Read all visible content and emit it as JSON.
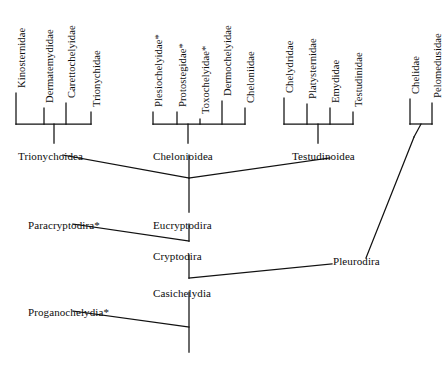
{
  "diagram": {
    "type": "cladogram",
    "title": "",
    "line_color": "#111111",
    "background_color": "#ffffff",
    "extinct_marker": "*",
    "terminal_taxa": [
      {
        "label": "Kinosternidae",
        "x": 16,
        "tip_y": 93,
        "label_y": 88
      },
      {
        "label": "Dermatemydidae",
        "x": 44,
        "tip_y": 108,
        "label_y": 88
      },
      {
        "label": "Carettochelyidae",
        "x": 66,
        "tip_y": 103,
        "label_y": 88
      },
      {
        "label": "Trionychidae",
        "x": 91,
        "tip_y": 112,
        "label_y": 88
      },
      {
        "label": "Plesiochelyidae*",
        "x": 153,
        "tip_y": 112,
        "label_y": 88
      },
      {
        "label": "Protostegidae*",
        "x": 177,
        "tip_y": 112,
        "label_y": 88
      },
      {
        "label": "Toxochelyidae*",
        "x": 200,
        "tip_y": 119,
        "label_y": 88
      },
      {
        "label": "Dermochelyidae",
        "x": 222,
        "tip_y": 101,
        "label_y": 88
      },
      {
        "label": "Cheloniidae",
        "x": 245,
        "tip_y": 108,
        "label_y": 88
      },
      {
        "label": "Chelydridae",
        "x": 284,
        "tip_y": 98,
        "label_y": 88
      },
      {
        "label": "Platysternidae",
        "x": 307,
        "tip_y": 104,
        "label_y": 88
      },
      {
        "label": "Emydidae",
        "x": 330,
        "tip_y": 108,
        "label_y": 88
      },
      {
        "label": "Testudinidae",
        "x": 353,
        "tip_y": 112,
        "label_y": 88
      },
      {
        "label": "Chelidae",
        "x": 410,
        "tip_y": 99,
        "label_y": 88
      },
      {
        "label": "Pelomedusidae",
        "x": 432,
        "tip_y": 103,
        "label_y": 88
      }
    ],
    "clade_labels": [
      {
        "name": "Trionychoidea",
        "label": "Trionychoidea",
        "x": 18,
        "y": 150
      },
      {
        "name": "Chelonioidea",
        "label": "Chelonioidea",
        "x": 153,
        "y": 150
      },
      {
        "name": "Testudinoidea",
        "label": "Testudinoidea",
        "x": 292,
        "y": 150
      },
      {
        "name": "Paracryptodira",
        "label": "Paracryptodira*",
        "x": 28,
        "y": 219
      },
      {
        "name": "Eucryptodira",
        "label": "Eucryptodira",
        "x": 153,
        "y": 219
      },
      {
        "name": "Cryptodira",
        "label": "Cryptodira",
        "x": 153,
        "y": 250
      },
      {
        "name": "Pleurodira",
        "label": "Pleurodira",
        "x": 333,
        "y": 255
      },
      {
        "name": "Casichelydia",
        "label": "Casichelydia",
        "x": 153,
        "y": 287
      },
      {
        "name": "Proganochelydia",
        "label": "Proganochelydia*",
        "x": 28,
        "y": 306
      }
    ]
  }
}
